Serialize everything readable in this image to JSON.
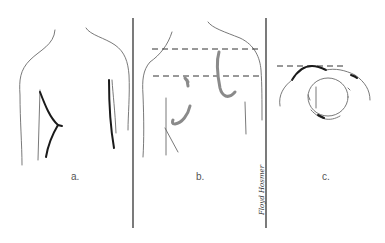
{
  "figure": {
    "panels": [
      {
        "id": "a",
        "label": "a."
      },
      {
        "id": "b",
        "label": "b."
      },
      {
        "id": "c",
        "label": "c."
      }
    ],
    "signature": "Floyd Hosmer",
    "colors": {
      "line": "#6a6a6a",
      "bold_line": "#1a1a1a",
      "shading": "#8a8a8a",
      "divider": "#333333",
      "background": "#ffffff"
    }
  }
}
